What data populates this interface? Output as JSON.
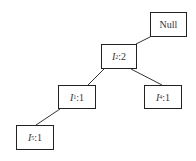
{
  "diagram": {
    "type": "tree",
    "nodes": [
      {
        "id": "root",
        "item": "Null",
        "sub": "",
        "count": "",
        "x": 150,
        "y": 12,
        "w": 37,
        "h": 25
      },
      {
        "id": "i2",
        "item": "I",
        "sub": "2",
        "count": ":2",
        "x": 101,
        "y": 44,
        "w": 36,
        "h": 25
      },
      {
        "id": "i1",
        "item": "I",
        "sub": "1",
        "count": ":1",
        "x": 58,
        "y": 85,
        "w": 38,
        "h": 24
      },
      {
        "id": "i4",
        "item": "I",
        "sub": "4",
        "count": ":1",
        "x": 144,
        "y": 85,
        "w": 38,
        "h": 24
      },
      {
        "id": "i5",
        "item": "I",
        "sub": "5",
        "count": ":1",
        "x": 16,
        "y": 125,
        "w": 38,
        "h": 25
      }
    ],
    "edges": [
      {
        "from": "root",
        "to": "i2"
      },
      {
        "from": "i2",
        "to": "i1"
      },
      {
        "from": "i2",
        "to": "i4"
      },
      {
        "from": "i1",
        "to": "i5"
      }
    ]
  }
}
